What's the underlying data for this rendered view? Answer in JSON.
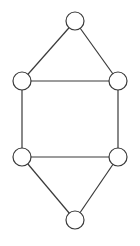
{
  "diagram": {
    "type": "undirected-graph",
    "colors": {
      "stroke": "#3a3a3a",
      "node_fill": "#ffffff",
      "background": "#ffffff"
    },
    "node_radius": 9,
    "nodes": [
      {
        "id": "top",
        "x": 75,
        "y": 21
      },
      {
        "id": "upper-left",
        "x": 22,
        "y": 81
      },
      {
        "id": "upper-right",
        "x": 118,
        "y": 81
      },
      {
        "id": "lower-left",
        "x": 22,
        "y": 157
      },
      {
        "id": "lower-right",
        "x": 118,
        "y": 157
      },
      {
        "id": "bottom",
        "x": 75,
        "y": 220
      }
    ],
    "edges": [
      [
        "top",
        "upper-left"
      ],
      [
        "top",
        "upper-right"
      ],
      [
        "upper-left",
        "upper-right"
      ],
      [
        "upper-left",
        "lower-left"
      ],
      [
        "upper-right",
        "lower-right"
      ],
      [
        "lower-left",
        "lower-right"
      ],
      [
        "lower-left",
        "bottom"
      ],
      [
        "lower-right",
        "bottom"
      ]
    ]
  }
}
